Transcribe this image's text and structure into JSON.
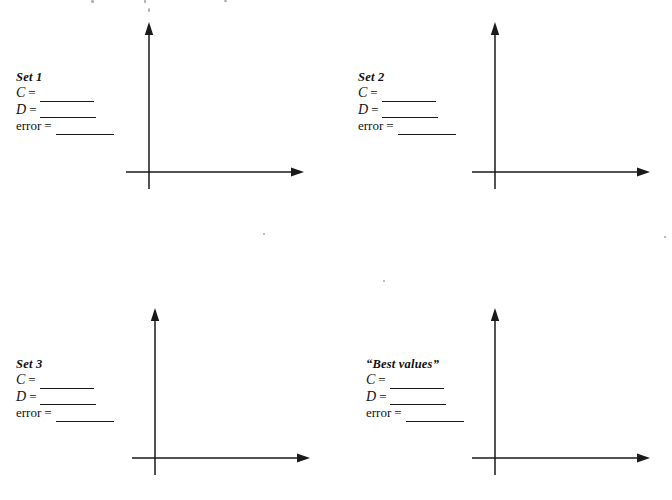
{
  "page": {
    "background_color": "#ffffff",
    "ink_color": "#1a1a1a",
    "width": 672,
    "height": 500
  },
  "fields": {
    "c_label": "C",
    "d_label": "D",
    "error_label": "error",
    "equals": "=",
    "blank_value": ""
  },
  "quadrants": [
    {
      "id": "set-1",
      "title": "Set 1",
      "title_style": "bold-italic",
      "label_x": 16,
      "label_y": 70,
      "axes": {
        "x": 126,
        "y": 20,
        "width": 180,
        "height": 160,
        "origin_x": 23,
        "origin_y": 152,
        "x_axis_end": 178,
        "y_axis_top": 2,
        "y_axis_stub": 17
      }
    },
    {
      "id": "set-2",
      "title": "Set 2",
      "title_style": "bold-italic",
      "label_x": 358,
      "label_y": 70,
      "axes": {
        "x": 472,
        "y": 20,
        "width": 180,
        "height": 160,
        "origin_x": 23,
        "origin_y": 152,
        "x_axis_end": 178,
        "y_axis_top": 2,
        "y_axis_stub": 17
      }
    },
    {
      "id": "set-3",
      "title": "Set 3",
      "title_style": "bold-italic",
      "label_x": 16,
      "label_y": 357,
      "axes": {
        "x": 132,
        "y": 306,
        "width": 180,
        "height": 160,
        "origin_x": 23,
        "origin_y": 152,
        "x_axis_end": 178,
        "y_axis_top": 2,
        "y_axis_stub": 17
      }
    },
    {
      "id": "best-values",
      "title": "“Best values”",
      "title_style": "bold-italic",
      "label_x": 366,
      "label_y": 357,
      "axes": {
        "x": 472,
        "y": 306,
        "width": 180,
        "height": 160,
        "origin_x": 23,
        "origin_y": 152,
        "x_axis_end": 178,
        "y_axis_top": 2,
        "y_axis_stub": 17
      }
    }
  ],
  "scan_artifacts": [
    {
      "x": 91,
      "y": 0,
      "w": 3,
      "h": 3
    },
    {
      "x": 144,
      "y": 0,
      "w": 2,
      "h": 3
    },
    {
      "x": 224,
      "y": 0,
      "w": 3,
      "h": 2
    },
    {
      "x": 148,
      "y": 8,
      "w": 2,
      "h": 4
    },
    {
      "x": 263,
      "y": 233,
      "w": 2,
      "h": 2
    },
    {
      "x": 383,
      "y": 280,
      "w": 2,
      "h": 2
    },
    {
      "x": 664,
      "y": 236,
      "w": 2,
      "h": 2
    }
  ]
}
